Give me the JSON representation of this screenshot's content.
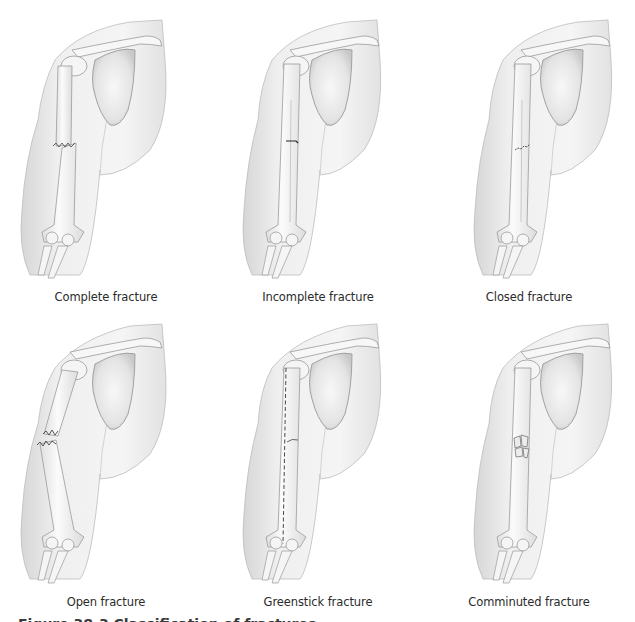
{
  "figure": {
    "caption": "Figure 38-3  Classification of fractures.",
    "panels": [
      {
        "label": "Complete fracture",
        "type": "complete"
      },
      {
        "label": "Incomplete fracture",
        "type": "incomplete"
      },
      {
        "label": "Closed fracture",
        "type": "closed"
      },
      {
        "label": "Open fracture",
        "type": "open"
      },
      {
        "label": "Greenstick fracture",
        "type": "greenstick"
      },
      {
        "label": "Comminuted fracture",
        "type": "comminuted"
      }
    ]
  },
  "colors": {
    "skin_fill": "#f2f2f2",
    "skin_shadow": "#d9d9d9",
    "bone_fill": "#f7f7f7",
    "outline": "#9a9a9a",
    "fracture_line": "#333333",
    "label_text": "#2b2b2b"
  }
}
